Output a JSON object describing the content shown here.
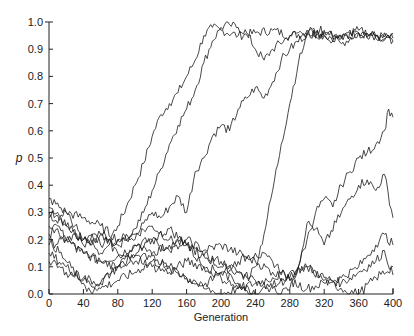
{
  "chart_data": {
    "type": "line",
    "title": "",
    "xlabel": "Generation",
    "ylabel": "p",
    "xlim": [
      0,
      400
    ],
    "ylim": [
      0.0,
      1.0
    ],
    "x_ticks": [
      0,
      40,
      80,
      120,
      160,
      200,
      240,
      280,
      320,
      360,
      400
    ],
    "x_tick_labels": [
      "0",
      "40",
      "80",
      "120",
      "160",
      "200",
      "240",
      "280",
      "320",
      "360",
      "400"
    ],
    "y_ticks": [
      0.0,
      0.1,
      0.2,
      0.3,
      0.4,
      0.5,
      0.6,
      0.7,
      0.8,
      0.9,
      1.0
    ],
    "y_tick_labels": [
      "0.0",
      "0.1",
      "0.2",
      "0.3",
      "0.4",
      "0.5",
      "0.6",
      "0.7",
      "0.8",
      "0.9",
      "1.0"
    ],
    "grid": false,
    "legend": null,
    "series": [
      {
        "name": "trajectory-1",
        "x": [
          0,
          10,
          20,
          30,
          40,
          50,
          60,
          70,
          80,
          90,
          100,
          110,
          120,
          130,
          140,
          150,
          160,
          170,
          180,
          190,
          200,
          220,
          240,
          260,
          280,
          300,
          320,
          340,
          360,
          380,
          400
        ],
        "values": [
          0.32,
          0.3,
          0.25,
          0.22,
          0.2,
          0.22,
          0.18,
          0.2,
          0.25,
          0.32,
          0.4,
          0.48,
          0.58,
          0.66,
          0.7,
          0.74,
          0.8,
          0.86,
          0.95,
          0.98,
          0.97,
          0.95,
          0.96,
          0.97,
          0.95,
          0.96,
          0.95,
          0.94,
          0.96,
          0.95,
          0.94
        ]
      },
      {
        "name": "trajectory-2",
        "x": [
          0,
          10,
          20,
          30,
          40,
          50,
          60,
          70,
          80,
          90,
          100,
          110,
          120,
          130,
          140,
          150,
          160,
          170,
          180,
          190,
          200,
          210,
          220,
          230,
          240,
          250,
          260,
          280,
          300,
          320,
          340,
          360,
          380,
          400
        ],
        "values": [
          0.28,
          0.26,
          0.3,
          0.25,
          0.2,
          0.18,
          0.22,
          0.2,
          0.18,
          0.2,
          0.24,
          0.3,
          0.38,
          0.46,
          0.55,
          0.62,
          0.68,
          0.75,
          0.85,
          0.93,
          0.98,
          0.99,
          0.98,
          0.96,
          0.9,
          0.86,
          0.9,
          0.95,
          0.97,
          0.95,
          0.92,
          0.96,
          0.95,
          0.93
        ]
      },
      {
        "name": "trajectory-3",
        "x": [
          0,
          10,
          20,
          30,
          40,
          50,
          60,
          70,
          80,
          90,
          100,
          110,
          120,
          130,
          140,
          150,
          160,
          170,
          180,
          190,
          200,
          210,
          220,
          230,
          240,
          250,
          260,
          270,
          280,
          300,
          320,
          340,
          360,
          380,
          400
        ],
        "values": [
          0.22,
          0.25,
          0.2,
          0.22,
          0.18,
          0.2,
          0.15,
          0.18,
          0.2,
          0.22,
          0.2,
          0.26,
          0.3,
          0.28,
          0.32,
          0.36,
          0.3,
          0.45,
          0.5,
          0.58,
          0.62,
          0.6,
          0.68,
          0.72,
          0.76,
          0.72,
          0.78,
          0.86,
          0.9,
          0.96,
          0.97,
          0.95,
          0.96,
          0.94,
          0.96
        ]
      },
      {
        "name": "trajectory-4",
        "x": [
          0,
          20,
          40,
          60,
          80,
          100,
          120,
          140,
          160,
          180,
          200,
          210,
          220,
          230,
          240,
          250,
          260,
          270,
          280,
          290,
          300,
          320,
          340,
          360,
          380,
          400
        ],
        "values": [
          0.18,
          0.2,
          0.15,
          0.12,
          0.14,
          0.18,
          0.2,
          0.16,
          0.18,
          0.14,
          0.12,
          0.1,
          0.08,
          0.06,
          0.1,
          0.22,
          0.38,
          0.55,
          0.7,
          0.85,
          0.95,
          0.96,
          0.94,
          0.97,
          0.95,
          0.93
        ]
      },
      {
        "name": "trajectory-5",
        "x": [
          0,
          20,
          40,
          60,
          80,
          100,
          120,
          140,
          160,
          180,
          200,
          220,
          240,
          260,
          270,
          280,
          290,
          300,
          310,
          320,
          330,
          340,
          350,
          360,
          370,
          380,
          390,
          395,
          400
        ],
        "values": [
          0.35,
          0.3,
          0.28,
          0.25,
          0.2,
          0.22,
          0.25,
          0.2,
          0.18,
          0.14,
          0.1,
          0.08,
          0.05,
          0.02,
          0.0,
          0.02,
          0.1,
          0.2,
          0.3,
          0.35,
          0.32,
          0.4,
          0.45,
          0.5,
          0.52,
          0.55,
          0.6,
          0.68,
          0.65
        ]
      },
      {
        "name": "trajectory-6",
        "x": [
          0,
          20,
          40,
          60,
          80,
          100,
          120,
          140,
          160,
          180,
          200,
          220,
          240,
          260,
          280,
          290,
          300,
          310,
          320,
          340,
          360,
          370,
          380,
          390,
          400
        ],
        "values": [
          0.3,
          0.25,
          0.2,
          0.22,
          0.15,
          0.12,
          0.15,
          0.18,
          0.2,
          0.16,
          0.18,
          0.15,
          0.12,
          0.08,
          0.05,
          0.1,
          0.26,
          0.24,
          0.18,
          0.3,
          0.4,
          0.42,
          0.38,
          0.44,
          0.28
        ]
      },
      {
        "name": "trajectory-7",
        "x": [
          0,
          20,
          40,
          60,
          80,
          100,
          120,
          140,
          160,
          180,
          200,
          220,
          240,
          260,
          280,
          300,
          320,
          340,
          360,
          370,
          380,
          390,
          400
        ],
        "values": [
          0.25,
          0.2,
          0.15,
          0.12,
          0.1,
          0.14,
          0.2,
          0.24,
          0.18,
          0.1,
          0.08,
          0.12,
          0.15,
          0.12,
          0.05,
          0.02,
          0.04,
          0.06,
          0.1,
          0.14,
          0.18,
          0.22,
          0.18
        ]
      },
      {
        "name": "trajectory-8",
        "x": [
          0,
          20,
          40,
          60,
          80,
          100,
          120,
          140,
          160,
          180,
          200,
          220,
          240,
          260,
          280,
          300,
          320,
          340,
          360,
          380,
          390,
          400
        ],
        "values": [
          0.15,
          0.1,
          0.05,
          0.02,
          0.05,
          0.08,
          0.12,
          0.1,
          0.06,
          0.02,
          0.0,
          0.02,
          0.04,
          0.06,
          0.08,
          0.1,
          0.06,
          0.04,
          0.08,
          0.12,
          0.16,
          0.07
        ]
      },
      {
        "name": "trajectory-9",
        "x": [
          0,
          20,
          40,
          50,
          60,
          80,
          100,
          120,
          140,
          160,
          180,
          200,
          220,
          240,
          260,
          280,
          300,
          320,
          340,
          360,
          380,
          400
        ],
        "values": [
          0.2,
          0.12,
          0.04,
          0.0,
          0.04,
          0.1,
          0.14,
          0.1,
          0.08,
          0.12,
          0.1,
          0.06,
          0.02,
          0.0,
          0.03,
          0.06,
          0.1,
          0.05,
          0.02,
          0.0,
          0.06,
          0.1
        ]
      },
      {
        "name": "trajectory-10",
        "x": [
          0,
          20,
          40,
          60,
          80,
          100,
          120,
          140,
          160,
          180,
          200,
          220,
          240
        ],
        "values": [
          0.12,
          0.08,
          0.06,
          0.04,
          0.1,
          0.18,
          0.14,
          0.1,
          0.06,
          0.03,
          0.08,
          0.04,
          0.0
        ]
      }
    ]
  }
}
